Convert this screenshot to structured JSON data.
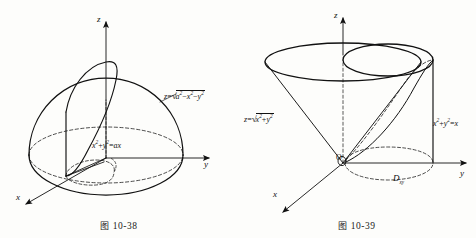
{
  "document": {
    "kind": "textbook-figure-pair",
    "background_color": "#fdfdfb",
    "ink_color": "#111111"
  },
  "figures": [
    {
      "id": "fig-10-38",
      "caption_cjk": "图",
      "caption_number": "10-38",
      "caption": "图 10-38",
      "description": "Upper hemisphere of radius a intersected by a vertical circular cylinder",
      "axes": [
        {
          "name": "z-axis",
          "label": "z"
        },
        {
          "name": "y-axis",
          "label": "y"
        },
        {
          "name": "x-axis",
          "label": "x"
        }
      ],
      "labels": [
        {
          "name": "sphere-equation",
          "text": "z=√(a²−x²−y²)",
          "lhs": "z",
          "op": "=",
          "radicand_parts": [
            "a",
            "2",
            "−",
            "x",
            "2",
            "−",
            "y",
            "2"
          ]
        },
        {
          "name": "cylinder-equation",
          "text": "x²+y²=ax",
          "parts": [
            "x",
            "2",
            "+",
            "y",
            "2",
            "=",
            "ax"
          ]
        }
      ]
    },
    {
      "id": "fig-10-39",
      "caption_cjk": "图",
      "caption_number": "10-39",
      "caption": "图 10-39",
      "description": "Cone z=sqrt(x^2+y^2) with cylinder x^2+y^2=x and projection region D_xy",
      "axes": [
        {
          "name": "z-axis",
          "label": "z"
        },
        {
          "name": "y-axis",
          "label": "y"
        },
        {
          "name": "x-axis",
          "label": "x"
        }
      ],
      "origin_label": "O",
      "labels": [
        {
          "name": "cone-equation",
          "text": "z=√(x²+y²)",
          "lhs": "z",
          "op": "="
        },
        {
          "name": "cylinder-equation",
          "text": "x²+y²=x"
        },
        {
          "name": "region-label",
          "base": "D",
          "subscript": "xy",
          "text": "Dxy"
        }
      ]
    }
  ]
}
